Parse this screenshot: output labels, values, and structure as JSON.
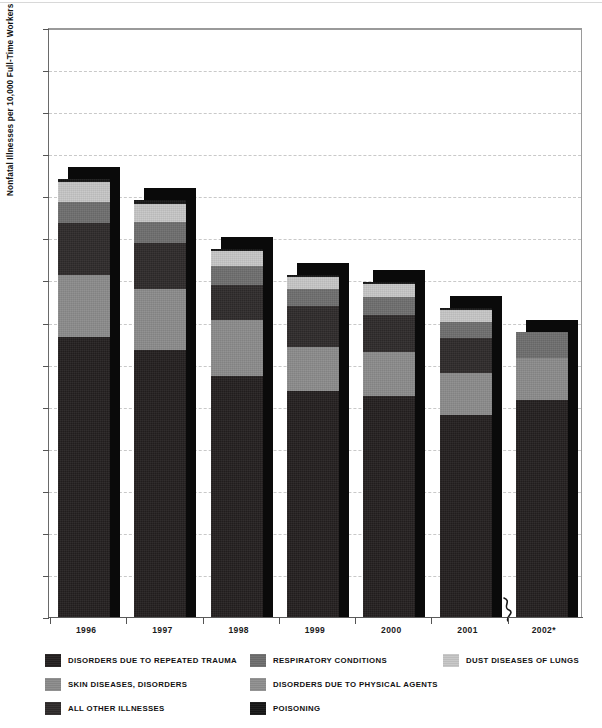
{
  "chart_data": {
    "type": "bar",
    "subtype": "stacked-bar",
    "title": "",
    "subtitle": "",
    "xlabel": "",
    "ylabel": "Nonfatal Illnesses per 10,000 Full-Time Workers",
    "ylim": [
      0,
      70
    ],
    "ytick_step": 5,
    "yticks": [
      0,
      5,
      10,
      15,
      20,
      25,
      30,
      35,
      40,
      45,
      50,
      55,
      60,
      65,
      70
    ],
    "ytick_labels": [
      "0",
      "5",
      "10",
      "15",
      "20",
      "25",
      "30",
      "35",
      "40",
      "45",
      "50",
      "55",
      "60",
      "65",
      "70"
    ],
    "grid": true,
    "grid_style": "dashed-horizontal",
    "legend_position": "below",
    "axis_break_before": "2002*",
    "categories": [
      "1996",
      "1997",
      "1998",
      "1999",
      "2000",
      "2001",
      "2002*"
    ],
    "series": [
      {
        "name": "DISORDERS DUE TO REPEATED TRAUMA",
        "color": "#231f1f",
        "values": [
          33.3,
          31.7,
          28.6,
          26.9,
          26.3,
          24.0,
          25.8
        ]
      },
      {
        "name": "SKIN DISEASES, DISORDERS",
        "color": "#8b8b8b",
        "values": [
          7.4,
          7.3,
          6.7,
          5.2,
          5.2,
          5.0,
          5.0
        ]
      },
      {
        "name": "ALL OTHER ILLNESSES",
        "color": "#2e2a2a",
        "values": [
          6.1,
          5.5,
          4.1,
          4.9,
          4.4,
          4.2,
          0.0
        ]
      },
      {
        "name": "RESPIRATORY CONDITIONS",
        "color": "#6e6e6e",
        "values": [
          2.5,
          2.4,
          2.3,
          2.0,
          2.1,
          1.9,
          3.1
        ]
      },
      {
        "name": "DUST DISEASES OF LUNGS",
        "color": "#c6c6c6",
        "values": [
          2.4,
          2.2,
          1.8,
          1.4,
          1.6,
          1.4,
          0.0
        ]
      },
      {
        "name": "POISONING",
        "color": "#161616",
        "values": [
          0.3,
          0.4,
          0.2,
          0.3,
          0.2,
          0.2,
          0.0
        ]
      }
    ],
    "totals": [
      52.0,
      49.5,
      43.7,
      40.7,
      39.8,
      36.7,
      33.9
    ]
  },
  "axis": {
    "y_title": "Nonfatal Illnesses per 10,000 Full-Time Workers",
    "y_labels": [
      "70",
      "65",
      "60",
      "55",
      "50",
      "45",
      "40",
      "35",
      "30",
      "25",
      "20",
      "15",
      "10",
      "5",
      "0"
    ],
    "x_labels": [
      "1996",
      "1997",
      "1998",
      "1999",
      "2000",
      "2001",
      "2002*"
    ]
  },
  "legend": {
    "items": [
      {
        "label": "DISORDERS DUE TO REPEATED TRAUMA",
        "color": "#231f1f"
      },
      {
        "label": "RESPIRATORY CONDITIONS",
        "color": "#6e6e6e"
      },
      {
        "label": "DUST DISEASES OF LUNGS",
        "color": "#c6c6c6"
      },
      {
        "label": "SKIN DISEASES, DISORDERS",
        "color": "#8b8b8b"
      },
      {
        "label": "DISORDERS DUE TO PHYSICAL AGENTS",
        "color": "#8f8f8f"
      },
      {
        "label": "ALL OTHER ILLNESSES",
        "color": "#2e2a2a"
      },
      {
        "label": "POISONING",
        "color": "#161616"
      }
    ]
  }
}
